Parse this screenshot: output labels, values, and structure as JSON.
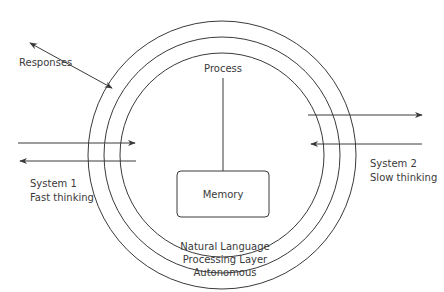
{
  "diagram": {
    "labels": {
      "responses": "Responses",
      "process": "Process",
      "memory": "Memory",
      "system1_line1": "System 1",
      "system1_line2": "Fast thinking",
      "system2_line1": "System 2",
      "system2_line2": "Slow thinking",
      "layer_line1": "Natural Language",
      "layer_line2": "Processing Layer",
      "layer_line3": "Autonomous"
    },
    "rings": [
      "outer-ring",
      "middle-ring",
      "inner-ring"
    ],
    "colors": {
      "stroke": "#3a3a3a",
      "text": "#3a3a3a",
      "background": "#ffffff"
    }
  }
}
